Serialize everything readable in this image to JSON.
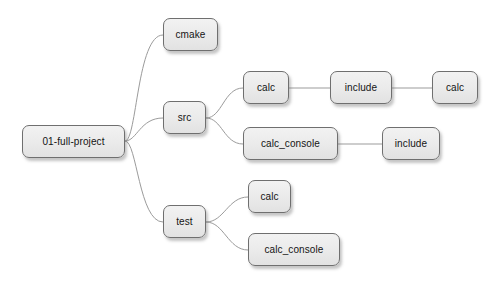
{
  "diagram": {
    "type": "tree",
    "orientation": "left-to-right",
    "canvas": {
      "width": 497,
      "height": 284,
      "background": "#ffffff"
    },
    "style": {
      "node_fill": "#eaeaea",
      "node_border": "#6f6f6f",
      "node_text": "#141414",
      "edge_color": "#9b9b9b",
      "shadow": "rgba(110,110,110,0.40)"
    },
    "nodes": [
      {
        "id": "root",
        "label": "01-full-project",
        "x": 22,
        "y": 125,
        "w": 103,
        "h": 33
      },
      {
        "id": "cmake",
        "label": "cmake",
        "x": 163,
        "y": 18,
        "w": 55,
        "h": 33
      },
      {
        "id": "src",
        "label": "src",
        "x": 163,
        "y": 101,
        "w": 43,
        "h": 33
      },
      {
        "id": "test",
        "label": "test",
        "x": 163,
        "y": 205,
        "w": 43,
        "h": 33
      },
      {
        "id": "src-calc",
        "label": "calc",
        "x": 243,
        "y": 71,
        "w": 46,
        "h": 33
      },
      {
        "id": "src-calc-include",
        "label": "include",
        "x": 330,
        "y": 71,
        "w": 62,
        "h": 33
      },
      {
        "id": "src-calc-include-calc",
        "label": "calc",
        "x": 432,
        "y": 71,
        "w": 46,
        "h": 33
      },
      {
        "id": "src-calc-console",
        "label": "calc_console",
        "x": 243,
        "y": 127,
        "w": 95,
        "h": 33
      },
      {
        "id": "src-calc-console-include",
        "label": "include",
        "x": 382,
        "y": 127,
        "w": 58,
        "h": 33
      },
      {
        "id": "test-calc",
        "label": "calc",
        "x": 248,
        "y": 180,
        "w": 43,
        "h": 33
      },
      {
        "id": "test-calc-console",
        "label": "calc_console",
        "x": 248,
        "y": 233,
        "w": 92,
        "h": 33
      }
    ],
    "edges": [
      {
        "id": "root-cmake",
        "from": "root",
        "to": "cmake",
        "shape": "curve",
        "path": "M125,141 C137,141 137,35 163,35"
      },
      {
        "id": "root-src",
        "from": "root",
        "to": "src",
        "shape": "curve",
        "path": "M125,141 C137,141 140,118 163,118"
      },
      {
        "id": "root-test",
        "from": "root",
        "to": "test",
        "shape": "curve",
        "path": "M125,141 C137,141 139,222 163,222"
      },
      {
        "id": "src-calc",
        "from": "src",
        "to": "src-calc",
        "shape": "curve",
        "path": "M206,118 C222,118 224,88 243,88"
      },
      {
        "id": "src-calc_console",
        "from": "src",
        "to": "src-calc-console",
        "shape": "curve",
        "path": "M206,118 C222,118 224,144 243,144"
      },
      {
        "id": "calc-include",
        "from": "src-calc",
        "to": "src-calc-include",
        "shape": "line",
        "path": "M289,88 L330,88"
      },
      {
        "id": "include-calc",
        "from": "src-calc-include",
        "to": "src-calc-include-calc",
        "shape": "line",
        "path": "M392,88 L432,88"
      },
      {
        "id": "calc_console-include",
        "from": "src-calc-console",
        "to": "src-calc-console-include",
        "shape": "line",
        "path": "M338,144 L382,144"
      },
      {
        "id": "test-calc",
        "from": "test",
        "to": "test-calc",
        "shape": "curve",
        "path": "M206,222 C224,222 228,197 248,197"
      },
      {
        "id": "test-calc_console",
        "from": "test",
        "to": "test-calc-console",
        "shape": "curve",
        "path": "M206,222 C224,222 228,250 248,250"
      }
    ]
  }
}
